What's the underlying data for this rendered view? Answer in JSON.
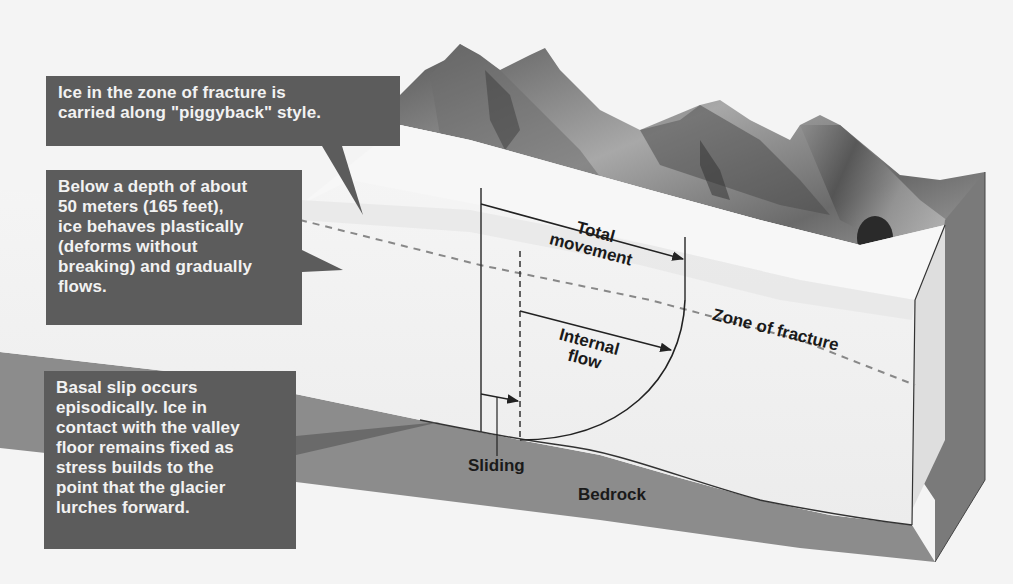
{
  "callouts": {
    "fracture_zone": "Ice in the zone of fracture is\ncarried along \"piggyback\" style.",
    "plastic_flow": "Below a depth of about\n50 meters (165 feet),\nice behaves plastically\n(deforms without\nbreaking) and gradually\nflows.",
    "basal_slip": "Basal slip occurs\nepisodically. Ice in\ncontact with the valley\nfloor remains fixed as\nstress builds to the\npoint that the glacier\nlurches forward."
  },
  "labels": {
    "total_movement_line1": "Total",
    "total_movement_line2": "movement",
    "internal_flow_line1": "Internal",
    "internal_flow_line2": "flow",
    "zone_of_fracture": "Zone of fracture",
    "sliding": "Sliding",
    "bedrock": "Bedrock"
  },
  "colors": {
    "callout_bg": "#5c5c5c",
    "callout_text": "#f2f2f2",
    "ice_top": "#f0f0f0",
    "ice_side": "#e2e2e2",
    "bedrock": "#8a8a8a",
    "bedrock_dark": "#6e6e6e",
    "mountains": "#7a7a7a",
    "label_text": "#1a1a1a"
  }
}
